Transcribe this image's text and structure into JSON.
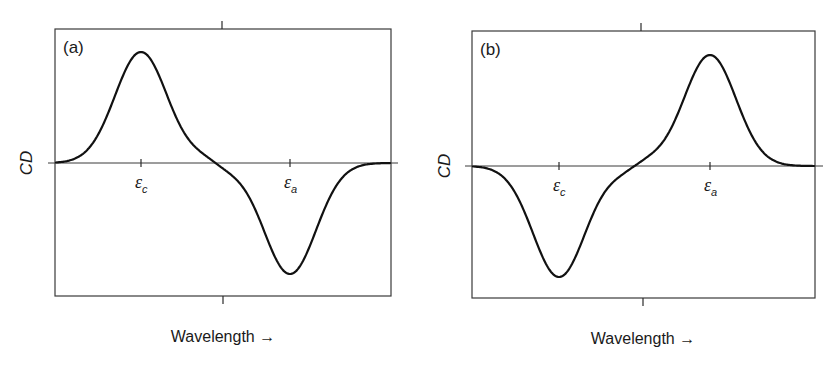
{
  "figure": {
    "panels": [
      {
        "label": "(a)",
        "ylabel": "CD",
        "xlabel": "Wavelength →",
        "tick_labels": [
          {
            "symbol": "ε",
            "sub": "c"
          },
          {
            "symbol": "ε",
            "sub": "a"
          }
        ]
      },
      {
        "label": "(b)",
        "ylabel": "CD",
        "xlabel": "Wavelength →",
        "tick_labels": [
          {
            "symbol": "ε",
            "sub": "c"
          },
          {
            "symbol": "ε",
            "sub": "a"
          }
        ]
      }
    ]
  },
  "chart_data": [
    {
      "type": "line",
      "title": "(a)",
      "xlabel": "Wavelength →",
      "ylabel": "CD",
      "x_ticks": [
        "εc",
        "εa"
      ],
      "grid": false,
      "description": "Bisignate CD couplet: positive band at εc, negative band at εa",
      "series": [
        {
          "name": "CD",
          "components": [
            {
              "center": "εc",
              "amplitude": 1.0,
              "relative_width": 0.26
            },
            {
              "center": "εa",
              "amplitude": -1.0,
              "relative_width": 0.26
            }
          ],
          "x": [
            0.0,
            0.1,
            0.2,
            0.3,
            0.4,
            0.5,
            0.6,
            0.7,
            0.8,
            0.9,
            1.0
          ],
          "values": [
            0.0,
            0.18,
            0.95,
            0.45,
            0.05,
            -0.05,
            -0.45,
            -0.95,
            -0.18,
            -0.01,
            0.0
          ]
        }
      ],
      "ylim": [
        -1.2,
        1.2
      ],
      "xlim": [
        0,
        1
      ],
      "geometry": {
        "frame": {
          "x0": 55,
          "y0": 29,
          "x1": 391,
          "y1": 296
        },
        "zero_y": 163,
        "zero_line_x": [
          48,
          398
        ],
        "tick_x": [
          141,
          290
        ],
        "top_tick_x": 222,
        "bottom_tick_x": 223,
        "peak_px": 111,
        "sigma_px": 26,
        "signs": [
          1,
          -1
        ],
        "xlabel_pos": [
          223,
          342
        ],
        "ylabel_pos": [
          26,
          163
        ],
        "panel_label_pos": [
          63,
          53
        ]
      }
    },
    {
      "type": "line",
      "title": "(b)",
      "xlabel": "Wavelength →",
      "ylabel": "CD",
      "x_ticks": [
        "εc",
        "εa"
      ],
      "grid": false,
      "description": "Bisignate CD couplet (opposite chirality): negative band at εc, positive band at εa",
      "series": [
        {
          "name": "CD",
          "components": [
            {
              "center": "εc",
              "amplitude": -1.0,
              "relative_width": 0.26
            },
            {
              "center": "εa",
              "amplitude": 1.0,
              "relative_width": 0.26
            }
          ],
          "x": [
            0.0,
            0.1,
            0.2,
            0.3,
            0.4,
            0.5,
            0.6,
            0.7,
            0.8,
            0.9,
            1.0
          ],
          "values": [
            0.0,
            -0.18,
            -0.95,
            -0.45,
            -0.05,
            0.05,
            0.45,
            0.95,
            0.18,
            0.01,
            0.0
          ]
        }
      ],
      "ylim": [
        -1.2,
        1.2
      ],
      "xlim": [
        0,
        1
      ],
      "geometry": {
        "frame": {
          "x0": 472,
          "y0": 31,
          "x1": 815,
          "y1": 298
        },
        "zero_y": 166,
        "zero_line_x": [
          465,
          823
        ],
        "tick_x": [
          559,
          710
        ],
        "top_tick_x": 641,
        "bottom_tick_x": 643,
        "peak_px": 111,
        "sigma_px": 26,
        "signs": [
          -1,
          1
        ],
        "xlabel_pos": [
          643,
          344
        ],
        "ylabel_pos": [
          444,
          166
        ],
        "panel_label_pos": [
          480,
          55
        ]
      }
    }
  ]
}
